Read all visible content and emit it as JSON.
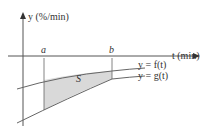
{
  "diagram": {
    "y_axis_label": "y (%/min)",
    "t_axis_label": "t (min)",
    "point_a": "a",
    "point_b": "b",
    "region_label": "S",
    "curve_f_label": "y = f(t)",
    "curve_g_label": "y = g(t)",
    "colors": {
      "axis": "#555555",
      "curve": "#666666",
      "region_fill": "#d9d9d9",
      "text": "#333333"
    }
  }
}
